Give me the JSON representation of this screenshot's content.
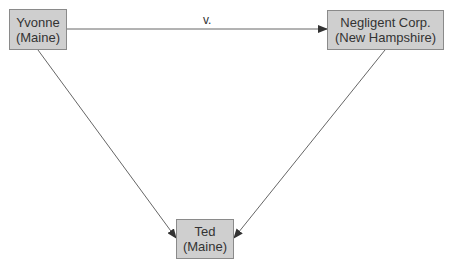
{
  "diagram": {
    "nodes": [
      {
        "id": "yvonne",
        "name": "Yvonne",
        "state": "(Maine)"
      },
      {
        "id": "negligent",
        "name": "Negligent Corp.",
        "state": "(New Hampshire)"
      },
      {
        "id": "ted",
        "name": "Ted",
        "state": "(Maine)"
      }
    ],
    "edges": [
      {
        "from": "yvonne",
        "to": "negligent",
        "label": "v."
      },
      {
        "from": "yvonne",
        "to": "ted",
        "label": ""
      },
      {
        "from": "negligent",
        "to": "ted",
        "label": ""
      }
    ],
    "colors": {
      "node_fill": "#cfcfcf",
      "node_border": "#8a8a8a",
      "line": "#555555"
    }
  }
}
